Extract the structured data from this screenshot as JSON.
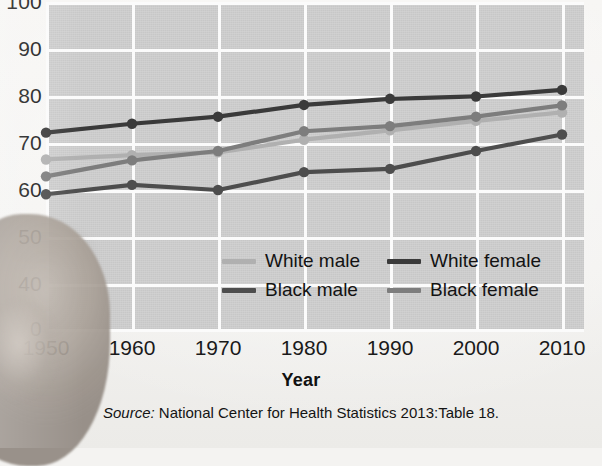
{
  "chart_data": {
    "type": "line",
    "title": "",
    "xlabel": "Year",
    "ylabel": "",
    "x": [
      1950,
      1960,
      1970,
      1980,
      1990,
      2000,
      2010
    ],
    "xticklabels": [
      "1950",
      "1960",
      "1970",
      "1980",
      "1990",
      "2000",
      "2010"
    ],
    "yticklabels": [
      "100",
      "90",
      "80",
      "70",
      "60",
      "50",
      "40",
      "0"
    ],
    "ylim": [
      40,
      100
    ],
    "y_axis_break": true,
    "y_axis_break_note": "Axis broken between 40 and 0",
    "grid": true,
    "legend_position": "inside-bottom-center",
    "series": [
      {
        "name": "White male",
        "color": "#b0b0b0",
        "values": [
          66.5,
          67.4,
          68.0,
          70.7,
          72.7,
          74.7,
          76.5
        ]
      },
      {
        "name": "White female",
        "color": "#3a3a3a",
        "values": [
          72.2,
          74.1,
          75.6,
          78.1,
          79.4,
          79.9,
          81.3
        ]
      },
      {
        "name": "Black male",
        "color": "#4d4d4d",
        "values": [
          59.1,
          61.1,
          60.0,
          63.8,
          64.5,
          68.3,
          71.8
        ]
      },
      {
        "name": "Black female",
        "color": "#7d7d7d",
        "values": [
          62.9,
          66.3,
          68.3,
          72.5,
          73.6,
          75.6,
          78.0
        ]
      }
    ],
    "annotations": []
  },
  "axis": {
    "x_title": "Year"
  },
  "legend": {
    "items": [
      {
        "label": "White male",
        "swatch": "#b0b0b0"
      },
      {
        "label": "White female",
        "swatch": "#3a3a3a"
      },
      {
        "label": "Black male",
        "swatch": "#4d4d4d"
      },
      {
        "label": "Black female",
        "swatch": "#7d7d7d"
      }
    ]
  },
  "source": {
    "prefix": "Source:",
    "text": "National Center for Health Statistics 2013:Table 18."
  },
  "colors": {
    "plot_background": "#cdcdcd",
    "gridline": "#fbfbfb",
    "page_background": "#f4f3f1",
    "text": "#1a1a1a"
  }
}
